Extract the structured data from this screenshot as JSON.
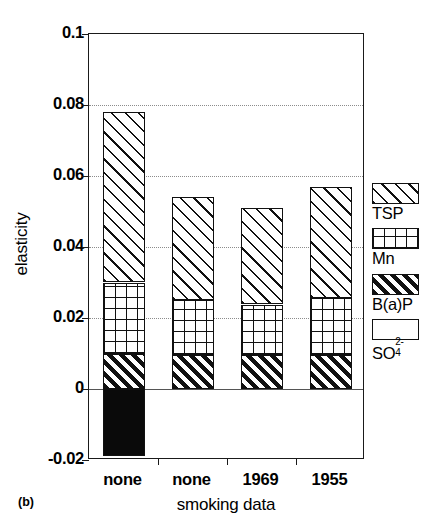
{
  "panel_label": "(b)",
  "axes": {
    "ylabel": "elasticity",
    "xlabel": "smoking data",
    "yticks": [
      "0.1",
      "0.08",
      "0.06",
      "0.04",
      "0.02",
      "0",
      "-0.02"
    ],
    "ytick_values": [
      0.1,
      0.08,
      0.06,
      0.04,
      0.02,
      0,
      -0.02
    ]
  },
  "legend": {
    "items": [
      {
        "label": "TSP",
        "pattern": "diagonal-hatch"
      },
      {
        "label": "Mn",
        "pattern": "grid-crosshatch"
      },
      {
        "label": "B(a)P",
        "pattern": "dense-diagonal-hatch"
      },
      {
        "label": "SO",
        "sup": "2-",
        "sub": "4",
        "pattern": "solid-black"
      }
    ]
  },
  "chart_data": {
    "type": "bar",
    "title": "",
    "xlabel": "smoking data",
    "ylabel": "elasticity",
    "ylim": [
      -0.02,
      0.1
    ],
    "grid": true,
    "stacked": true,
    "legend_position": "right",
    "categories": [
      "none",
      "none",
      "1969",
      "1955"
    ],
    "series": [
      {
        "name": "SO4^2-",
        "values": [
          -0.019,
          0.0,
          0.0,
          0.0
        ]
      },
      {
        "name": "B(a)P",
        "values": [
          0.01,
          0.0095,
          0.0095,
          0.0095
        ]
      },
      {
        "name": "Mn",
        "values": [
          0.02,
          0.0155,
          0.0143,
          0.016
        ]
      },
      {
        "name": "TSP",
        "values": [
          0.048,
          0.029,
          0.0272,
          0.0315
        ]
      }
    ],
    "bar_tops": [
      0.078,
      0.054,
      0.051,
      0.057
    ],
    "segment_boundaries": [
      {
        "category": "none",
        "so4_bottom": -0.019,
        "zero": 0,
        "bap_top": 0.01,
        "mn_top": 0.03,
        "tsp_top": 0.078
      },
      {
        "category": "none",
        "so4_bottom": 0,
        "zero": 0,
        "bap_top": 0.0095,
        "mn_top": 0.025,
        "tsp_top": 0.054
      },
      {
        "category": "1969",
        "so4_bottom": 0,
        "zero": 0,
        "bap_top": 0.0095,
        "mn_top": 0.0238,
        "tsp_top": 0.051
      },
      {
        "category": "1955",
        "so4_bottom": 0,
        "zero": 0,
        "bap_top": 0.0095,
        "mn_top": 0.0255,
        "tsp_top": 0.057
      }
    ]
  }
}
